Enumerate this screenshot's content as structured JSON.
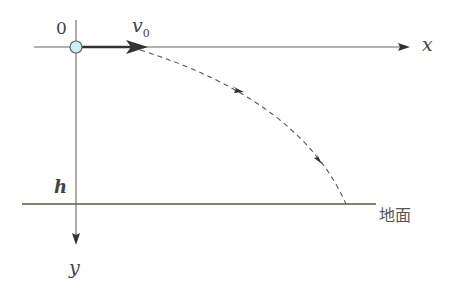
{
  "diagram": {
    "title": "",
    "labels": {
      "origin": "0",
      "velocity": "v",
      "velocity_sub": "0",
      "x_axis": "x",
      "y_axis": "y",
      "height": "h",
      "ground": "地面"
    },
    "colors": {
      "axis": "#555555",
      "ground": "#8a8270",
      "trajectory": "#555555",
      "velocity_arrow": "#333333",
      "ball_fill": "#cdeef2",
      "ball_stroke": "#5a6a6e"
    }
  }
}
